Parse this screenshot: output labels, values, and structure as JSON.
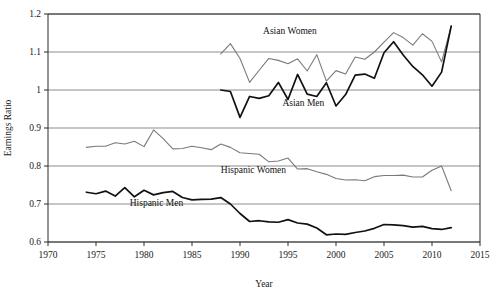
{
  "chart_data": {
    "type": "line",
    "title": "",
    "xlabel": "Year",
    "ylabel": "Earnings Ratio",
    "xlim": [
      1970,
      2015
    ],
    "ylim": [
      0.6,
      1.2
    ],
    "xticks": [
      1970,
      1975,
      1980,
      1985,
      1990,
      1995,
      2000,
      2005,
      2010,
      2015
    ],
    "yticks": [
      0.6,
      0.7,
      0.8,
      0.9,
      1.0,
      1.1,
      1.2
    ],
    "ytick_labels": [
      "0.6",
      "0.7",
      "0.8",
      "0.9",
      "1",
      "1.1",
      "1.2"
    ],
    "xtick_labels": [
      "1970",
      "1975",
      "1980",
      "1985",
      "1990",
      "1995",
      "2000",
      "2005",
      "2010",
      "2015"
    ],
    "grid": "horizontal",
    "legend": "inline-annotations",
    "series": [
      {
        "name": "Asian Women",
        "color": "#7a7a7a",
        "width": 1.1,
        "label_x": 1995.2,
        "label_y": 1.148,
        "x": [
          1988,
          1989,
          1990,
          1991,
          1992,
          1993,
          1994,
          1995,
          1996,
          1997,
          1998,
          1999,
          2000,
          2001,
          2002,
          2003,
          2004,
          2005,
          2006,
          2007,
          2008,
          2009,
          2010,
          2011,
          2012
        ],
        "values": [
          1.095,
          1.122,
          1.083,
          1.02,
          1.052,
          1.083,
          1.078,
          1.069,
          1.082,
          1.05,
          1.093,
          1.0235,
          1.051,
          1.042,
          1.087,
          1.081,
          1.1,
          1.126,
          1.151,
          1.138,
          1.118,
          1.148,
          1.128,
          1.074,
          1.168
        ]
      },
      {
        "name": "Asian Men",
        "color": "#111111",
        "width": 1.7,
        "label_x": 1996.6,
        "label_y": 0.958,
        "x": [
          1988,
          1989,
          1990,
          1991,
          1992,
          1993,
          1994,
          1995,
          1996,
          1997,
          1998,
          1999,
          2000,
          2001,
          2002,
          2003,
          2004,
          2005,
          2006,
          2007,
          2008,
          2009,
          2010,
          2011,
          2012
        ],
        "values": [
          1.0,
          0.996,
          0.928,
          0.983,
          0.978,
          0.985,
          1.02,
          0.975,
          1.041,
          0.989,
          0.983,
          1.019,
          0.958,
          0.988,
          1.039,
          1.042,
          1.031,
          1.098,
          1.127,
          1.092,
          1.062,
          1.04,
          1.01,
          1.047,
          1.168
        ]
      },
      {
        "name": "Hispanic Women",
        "color": "#7a7a7a",
        "width": 1.1,
        "label_x": 1991.4,
        "label_y": 0.782,
        "x": [
          1974,
          1975,
          1976,
          1977,
          1978,
          1979,
          1980,
          1981,
          1982,
          1983,
          1984,
          1985,
          1986,
          1987,
          1988,
          1989,
          1990,
          1991,
          1992,
          1993,
          1994,
          1995,
          1996,
          1997,
          1998,
          1999,
          2000,
          2001,
          2002,
          2003,
          2004,
          2005,
          2006,
          2007,
          2008,
          2009,
          2010,
          2011,
          2012
        ],
        "values": [
          0.849,
          0.852,
          0.852,
          0.861,
          0.858,
          0.865,
          0.851,
          0.895,
          0.872,
          0.845,
          0.846,
          0.852,
          0.848,
          0.843,
          0.858,
          0.849,
          0.835,
          0.833,
          0.831,
          0.811,
          0.813,
          0.821,
          0.792,
          0.793,
          0.785,
          0.778,
          0.767,
          0.763,
          0.764,
          0.761,
          0.772,
          0.775,
          0.775,
          0.776,
          0.771,
          0.771,
          0.789,
          0.8,
          0.735
        ]
      },
      {
        "name": "Hispanic Men",
        "color": "#111111",
        "width": 1.7,
        "label_x": 1981.3,
        "label_y": 0.694,
        "x": [
          1974,
          1975,
          1976,
          1977,
          1978,
          1979,
          1980,
          1981,
          1982,
          1983,
          1984,
          1985,
          1986,
          1987,
          1988,
          1989,
          1990,
          1991,
          1992,
          1993,
          1994,
          1995,
          1996,
          1997,
          1998,
          1999,
          2000,
          2001,
          2002,
          2003,
          2004,
          2005,
          2006,
          2007,
          2008,
          2009,
          2010,
          2011,
          2012
        ],
        "values": [
          0.731,
          0.727,
          0.734,
          0.721,
          0.743,
          0.719,
          0.736,
          0.724,
          0.73,
          0.733,
          0.717,
          0.711,
          0.712,
          0.713,
          0.717,
          0.7,
          0.675,
          0.654,
          0.656,
          0.653,
          0.652,
          0.659,
          0.65,
          0.647,
          0.637,
          0.619,
          0.621,
          0.62,
          0.625,
          0.629,
          0.636,
          0.646,
          0.645,
          0.643,
          0.639,
          0.641,
          0.635,
          0.633,
          0.638
        ]
      }
    ]
  }
}
